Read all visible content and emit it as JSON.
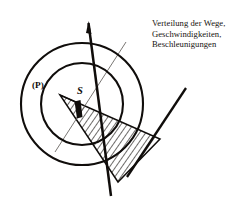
{
  "figure": {
    "caption": {
      "lines": [
        "Verteilung der Wege,",
        "Geschwindigkeiten,",
        "Beschleunigungen"
      ]
    },
    "labels": {
      "point_p": "(P)",
      "center_s": "S"
    },
    "colors": {
      "ink": "#100d0b",
      "paper": "#ffffff",
      "thin_line": "#5d5a57",
      "hatch": "#16120f"
    },
    "geometry": {
      "outer_circle": {
        "cx": 82,
        "cy": 104,
        "r": 61
      },
      "inner_circle": {
        "cx": 82,
        "cy": 104,
        "r": 41
      },
      "point_p": {
        "x": 60,
        "y": 95
      },
      "center_s": {
        "x": 82,
        "y": 104
      },
      "thick_line_a": {
        "x1": 88,
        "y1": 22,
        "x2": 111,
        "y2": 196
      },
      "thick_line_b": {
        "x1": 186,
        "y1": 89,
        "x2": 128,
        "y2": 176
      },
      "thin_line": {
        "x1": 126,
        "y1": 42,
        "x2": 55,
        "y2": 152
      },
      "wedge": [
        {
          "x": 60,
          "y": 95
        },
        {
          "x": 160,
          "y": 139
        },
        {
          "x": 118,
          "y": 182
        }
      ],
      "marker": {
        "x": 78,
        "y": 108,
        "w": 5,
        "h": 14,
        "angle": 22
      }
    }
  }
}
